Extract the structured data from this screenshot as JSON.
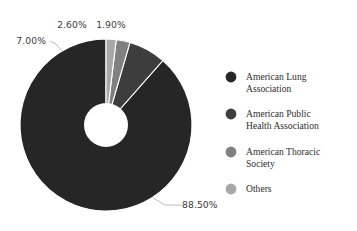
{
  "chart_data": {
    "type": "pie",
    "variant": "donut",
    "title": "",
    "subtitle": "",
    "xlabel": "",
    "ylabel": "",
    "grid": false,
    "legend_position": "right",
    "start_angle_deg": 90,
    "direction": "counterclockwise",
    "hole_ratio": 0.26,
    "labels": [
      "American Lung Association",
      "American Public Health Association",
      "American Thoracic Society",
      "Others"
    ],
    "values": [
      88.5,
      7.0,
      2.6,
      1.9
    ],
    "value_labels": [
      "88.50%",
      "7.00%",
      "2.60%",
      "1.90%"
    ],
    "colors": [
      "#262626",
      "#3d3d3d",
      "#808080",
      "#a8a8a8"
    ],
    "slices": [
      {
        "label": "American Lung Association",
        "value": 88.5,
        "value_label": "88.50%",
        "color": "#262626"
      },
      {
        "label": "American Public Health Association",
        "value": 7.0,
        "value_label": "7.00%",
        "color": "#3d3d3d"
      },
      {
        "label": "American Thoracic Society",
        "value": 2.6,
        "value_label": "2.60%",
        "color": "#808080"
      },
      {
        "label": "Others",
        "value": 1.9,
        "value_label": "1.90%",
        "color": "#a8a8a8"
      }
    ]
  },
  "annotations": {
    "pct_88_50": "88.50%",
    "pct_7_00": "7.00%",
    "pct_2_60": "2.60%",
    "pct_1_90": "1.90%"
  },
  "legend": {
    "items": [
      {
        "label_line1": "American Lung",
        "label_line2": "Association",
        "marker": "legend-dot-icon",
        "color": "#262626"
      },
      {
        "label_line1": "American Public",
        "label_line2": "Health Association",
        "marker": "legend-dot-icon",
        "color": "#3d3d3d"
      },
      {
        "label_line1": "American Thoracic",
        "label_line2": "Society",
        "marker": "legend-dot-icon",
        "color": "#808080"
      },
      {
        "label_line1": "Others",
        "label_line2": "",
        "marker": "legend-dot-icon",
        "color": "#a8a8a8"
      }
    ]
  },
  "style": {
    "background": "#ffffff",
    "label_color": "#3a3a3a",
    "legend_text_color": "#2e2e2e",
    "leader_line_color": "#b4b4b4"
  }
}
